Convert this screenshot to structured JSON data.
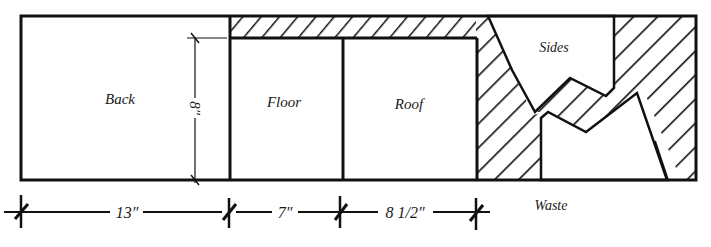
{
  "diagram": {
    "type": "cutting-layout",
    "panels": [
      {
        "id": "back",
        "label": "Back"
      },
      {
        "id": "floor",
        "label": "Floor"
      },
      {
        "id": "roof",
        "label": "Roof"
      },
      {
        "id": "sides",
        "label": "Sides"
      }
    ],
    "waste_label": "Waste",
    "dimensions": {
      "height": "8″",
      "back_width": "13″",
      "floor_width": "7″",
      "roof_width": "8 1/2″"
    },
    "colors": {
      "line": "#111111",
      "background": "#ffffff"
    }
  }
}
